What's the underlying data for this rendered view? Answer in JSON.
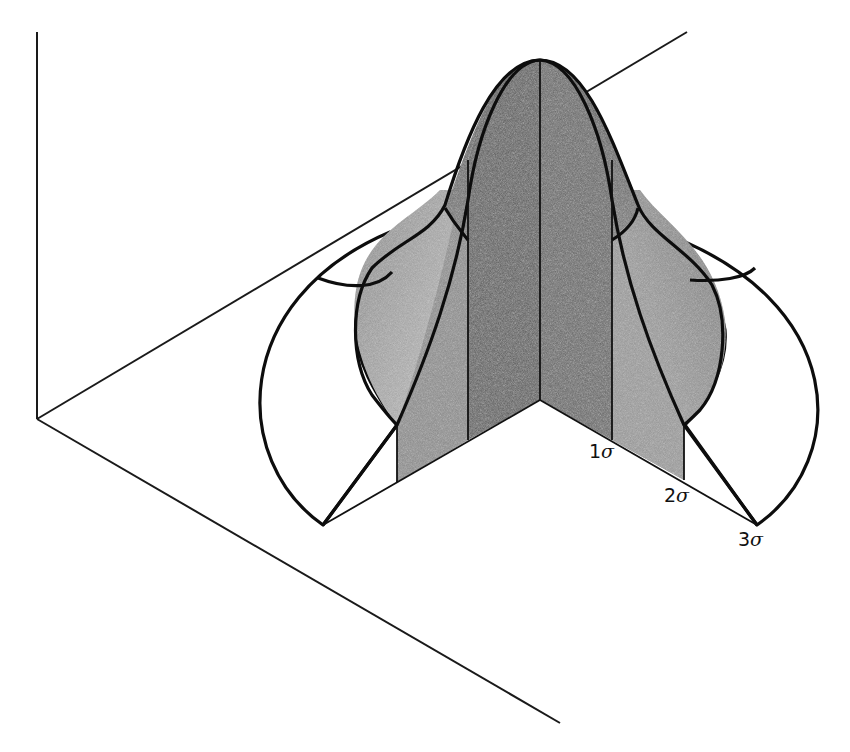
{
  "figure": {
    "labels": {
      "sigma1": {
        "num": "1",
        "sym": "σ"
      },
      "sigma2": {
        "num": "2",
        "sym": "σ"
      },
      "sigma3": {
        "num": "3",
        "sym": "σ"
      }
    },
    "colors": {
      "background": "#ffffff",
      "line": "#111111",
      "inner_wall": "#5a5a5a",
      "outer_wall": "#9a9a9a",
      "cap": "#6e6e6e",
      "skirt": "#a8a8a8",
      "ring_3sigma": "#ffffff"
    }
  }
}
